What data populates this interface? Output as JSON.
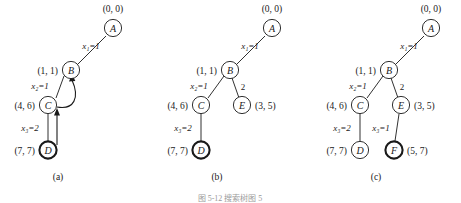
{
  "figure": {
    "caption": "图 5-12  搜索树图 5",
    "panels": [
      {
        "id": "a",
        "caption": "(a)",
        "nodes": [
          {
            "id": "A",
            "letter": "A",
            "coord": "(0, 0)",
            "coord_side": "above",
            "bold": false
          },
          {
            "id": "B",
            "letter": "B",
            "coord": "(1, 1)",
            "coord_side": "left",
            "bold": false
          },
          {
            "id": "C",
            "letter": "C",
            "coord": "(4, 6)",
            "coord_side": "left",
            "bold": false
          },
          {
            "id": "D",
            "letter": "D",
            "coord": "(7, 7)",
            "coord_side": "left",
            "bold": true
          }
        ],
        "edges": [
          {
            "from": "A",
            "to": "B",
            "label": "x₁=1",
            "style": "line"
          },
          {
            "from": "B",
            "to": "C",
            "label": "x₂=1",
            "style": "line"
          },
          {
            "from": "C",
            "to": "B",
            "label": "",
            "style": "curved-arrow"
          },
          {
            "from": "C",
            "to": "D",
            "label": "x₃=2",
            "style": "line"
          },
          {
            "from": "D",
            "to": "C",
            "label": "",
            "style": "arrow"
          }
        ]
      },
      {
        "id": "b",
        "caption": "(b)",
        "nodes": [
          {
            "id": "A",
            "letter": "A",
            "coord": "(0, 0)",
            "coord_side": "above",
            "bold": false
          },
          {
            "id": "B",
            "letter": "B",
            "coord": "(1, 1)",
            "coord_side": "left",
            "bold": false
          },
          {
            "id": "C",
            "letter": "C",
            "coord": "(4, 6)",
            "coord_side": "left",
            "bold": false
          },
          {
            "id": "E",
            "letter": "E",
            "coord": "(3, 5)",
            "coord_side": "right",
            "bold": false
          },
          {
            "id": "D",
            "letter": "D",
            "coord": "(7, 7)",
            "coord_side": "left",
            "bold": true
          }
        ],
        "edges": [
          {
            "from": "A",
            "to": "B",
            "label": "x₁=1",
            "style": "line"
          },
          {
            "from": "B",
            "to": "C",
            "label": "x₂=1",
            "style": "line"
          },
          {
            "from": "B",
            "to": "E",
            "label": "2",
            "style": "line"
          },
          {
            "from": "C",
            "to": "D",
            "label": "x₃=2",
            "style": "line"
          }
        ]
      },
      {
        "id": "c",
        "caption": "(c)",
        "nodes": [
          {
            "id": "A",
            "letter": "A",
            "coord": "(0, 0)",
            "coord_side": "above",
            "bold": false
          },
          {
            "id": "B",
            "letter": "B",
            "coord": "(1, 1)",
            "coord_side": "left",
            "bold": false
          },
          {
            "id": "C",
            "letter": "C",
            "coord": "(4, 6)",
            "coord_side": "left",
            "bold": false
          },
          {
            "id": "E",
            "letter": "E",
            "coord": "(3, 5)",
            "coord_side": "right",
            "bold": false
          },
          {
            "id": "D",
            "letter": "D",
            "coord": "(7, 7)",
            "coord_side": "left",
            "bold": false
          },
          {
            "id": "F",
            "letter": "F",
            "coord": "(5, 7)",
            "coord_side": "right",
            "bold": true
          }
        ],
        "edges": [
          {
            "from": "A",
            "to": "B",
            "label": "x₁=1",
            "style": "line"
          },
          {
            "from": "B",
            "to": "C",
            "label": "x₂=1",
            "style": "line"
          },
          {
            "from": "B",
            "to": "E",
            "label": "2",
            "style": "line"
          },
          {
            "from": "C",
            "to": "D",
            "label": "x₃=2",
            "style": "line"
          },
          {
            "from": "E",
            "to": "F",
            "label": "x₃=1",
            "style": "line"
          }
        ]
      }
    ]
  },
  "labels": {
    "panel_a": {
      "node_A": "A",
      "node_B": "B",
      "node_C": "C",
      "node_D": "D",
      "coord_A": "(0, 0)",
      "coord_B": "(1, 1)",
      "coord_C": "(4, 6)",
      "coord_D": "(7, 7)",
      "edge_AB": "x₁=1",
      "edge_BC": "x₂=1",
      "edge_CD": "x₃=2",
      "caption": "(a)"
    },
    "panel_b": {
      "node_A": "A",
      "node_B": "B",
      "node_C": "C",
      "node_D": "D",
      "node_E": "E",
      "coord_A": "(0, 0)",
      "coord_B": "(1, 1)",
      "coord_C": "(4, 6)",
      "coord_D": "(7, 7)",
      "coord_E": "(3, 5)",
      "edge_AB": "x₁=1",
      "edge_BC": "x₂=1",
      "edge_BE": "2",
      "edge_CD": "x₃=2",
      "caption": "(b)"
    },
    "panel_c": {
      "node_A": "A",
      "node_B": "B",
      "node_C": "C",
      "node_D": "D",
      "node_E": "E",
      "node_F": "F",
      "coord_A": "(0, 0)",
      "coord_B": "(1, 1)",
      "coord_C": "(4, 6)",
      "coord_D": "(7, 7)",
      "coord_E": "(3, 5)",
      "coord_F": "(5, 7)",
      "edge_AB": "x₁=1",
      "edge_BC": "x₂=1",
      "edge_BE": "2",
      "edge_CD": "x₃=2",
      "edge_EF": "x₃=1",
      "caption": "(c)"
    },
    "figure_caption": "图 5-12  搜索树图 5"
  },
  "colors": {
    "ink": "#1a1a1a",
    "background": "#ffffff",
    "faded_caption": "#9a9a9a"
  }
}
